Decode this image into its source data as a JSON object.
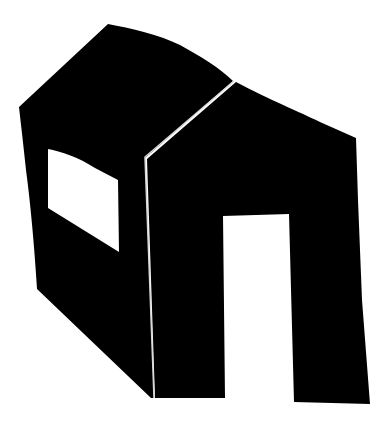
{
  "figure": {
    "colors": {
      "background": "#ffffff",
      "fill": "#000000",
      "seam": "#d8d8d8",
      "openings": "#ffffff"
    },
    "parts": {
      "side_wall_with_roof": "side-wall",
      "front_gable_wall": "front-wall",
      "window": "window",
      "door": "door",
      "seam": "ridge-seam"
    }
  }
}
